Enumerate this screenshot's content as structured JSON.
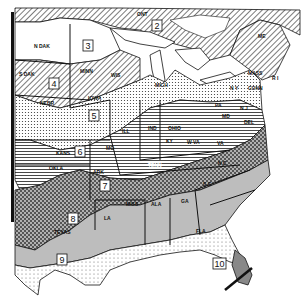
{
  "map": {
    "title": "",
    "type": "climate zone map of eastern United States",
    "zones": [
      {
        "number": "2",
        "pattern": "diagonal-hatch",
        "region": "Ontario / Canada"
      },
      {
        "number": "3",
        "pattern": "blank",
        "region": "North Dakota / Minnesota"
      },
      {
        "number": "4",
        "pattern": "diagonal-hatch",
        "region": "South Dakota / Minnesota / Wisconsin"
      },
      {
        "number": "5",
        "pattern": "dots",
        "region": "Nebraska / Iowa / Michigan"
      },
      {
        "number": "6",
        "pattern": "horizontal-lines",
        "region": "Kansas / Missouri / Ohio Valley"
      },
      {
        "number": "7",
        "pattern": "crosshatch-dark",
        "region": "Arkansas / Tennessee"
      },
      {
        "number": "8",
        "pattern": "gray",
        "region": "Texas / Deep South"
      },
      {
        "number": "9",
        "pattern": "light-dots",
        "region": "South Texas / Gulf Coast"
      },
      {
        "number": "10",
        "pattern": "vertical-lines",
        "region": "South Florida"
      }
    ],
    "state_labels": {
      "ont": "ONT",
      "ndak": "N DAK",
      "sdak": "S DAK",
      "minn": "MINN",
      "wis": "WIS",
      "nebr": "NEBR",
      "iowa": "IOWA",
      "mich": "MICH",
      "ill": "ILL",
      "ind": "IND",
      "ohio": "OHIO",
      "kans": "KANS",
      "mo": "MO",
      "okla": "OKLA",
      "ark": "ARK",
      "ky": "KY",
      "wva": "W VA",
      "va": "VA",
      "tenn": "TENN",
      "nc": "N C",
      "sc": "S C",
      "miss": "MISS",
      "ala": "ALA",
      "ga": "GA",
      "la": "LA",
      "fla": "FLA",
      "texas": "TEXAS",
      "pa": "PA",
      "ny": "N Y",
      "nj": "N J",
      "del": "DEL",
      "md": "MD",
      "conn": "CONN",
      "mass": "MASS",
      "ri": "R I",
      "vt": "VT",
      "nh": "N H",
      "me": "ME"
    }
  }
}
